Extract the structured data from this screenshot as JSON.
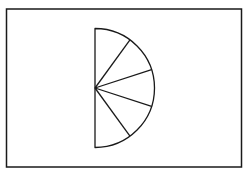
{
  "canvas": {
    "width": 247,
    "height": 174,
    "background": "#ffffff"
  },
  "frame": {
    "x": 6.5,
    "y": 9,
    "width": 235,
    "height": 158,
    "stroke": "#1a1a1a",
    "stroke_width": 1.5
  },
  "figure": {
    "type": "semicircle-sectors",
    "center": {
      "x": 95,
      "y": 88
    },
    "radius": 59.5,
    "sector_count": 5,
    "sector_angle_deg": 36,
    "stroke": "#1a1a1a",
    "stroke_width": 1.3
  }
}
